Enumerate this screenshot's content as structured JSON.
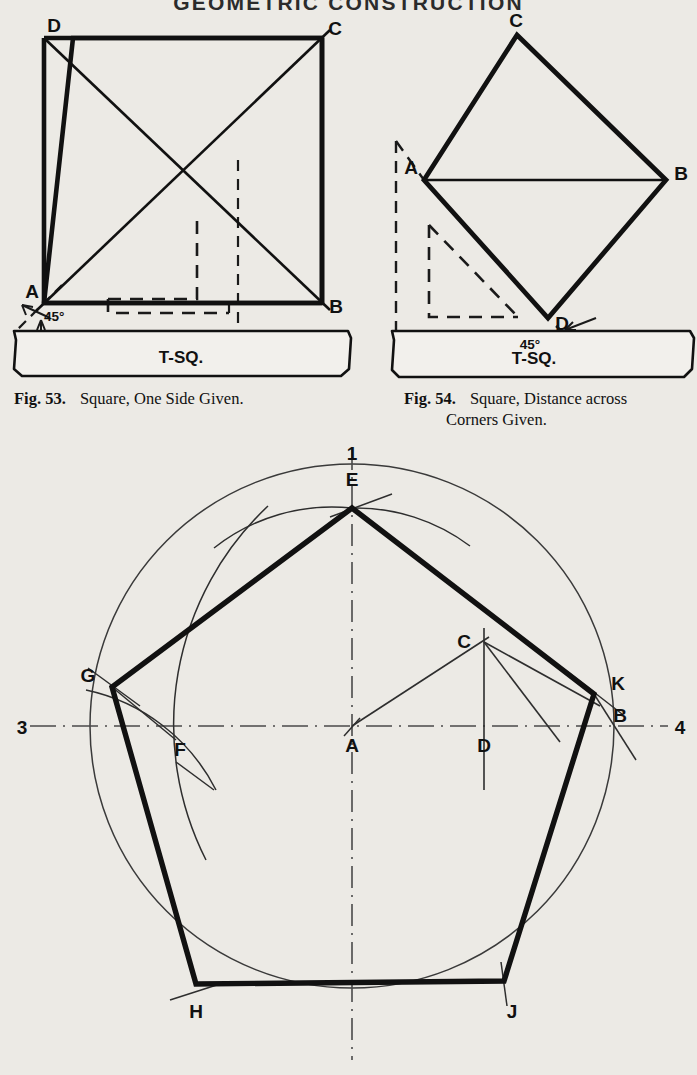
{
  "page": {
    "running_head": "GEOMETRIC CONSTRUCTION",
    "width": 697,
    "height": 1075,
    "paper_color": "#eceae5",
    "ink_color": "#111111"
  },
  "figures": [
    {
      "id": "fig-53",
      "number": "Fig. 53.",
      "caption": "Square, One Side Given.",
      "caption_lines": [
        "Square, One Side Given."
      ],
      "tool_label": "T-SQ.",
      "angle_label": "45°",
      "vertex_labels": [
        "D",
        "C",
        "A",
        "B"
      ],
      "description": "Square ABCD drawn with T-square and 45 degree triangle, diagonals shown"
    },
    {
      "id": "fig-54",
      "number": "Fig. 54.",
      "caption": "Square, Distance across Corners Given.",
      "caption_lines": [
        "Square, Distance across",
        "Corners Given."
      ],
      "tool_label": "T-SQ.",
      "angle_label": "45°",
      "vertex_labels": [
        "C",
        "A",
        "B",
        "D"
      ],
      "description": "Square on diagonal ACBD with horizontal diagonal AB"
    },
    {
      "id": "fig-pentagon",
      "vertex_labels": [
        "E",
        "G",
        "K",
        "H",
        "J"
      ],
      "construction_labels": [
        "A",
        "B",
        "C",
        "D",
        "F"
      ],
      "axis_labels": {
        "left": "3",
        "right": "4",
        "top": "1"
      },
      "description": "Regular pentagon inscribed in a circle, center A, constructed from radius bisection"
    }
  ],
  "drawing": {
    "fig53": {
      "square": {
        "ax": 44,
        "ay": 303,
        "bx": 322,
        "by": 303,
        "cx": 322,
        "cy": 38,
        "dx": 73,
        "dy": 38
      },
      "labels": {
        "D": "D",
        "C": "C",
        "A": "A",
        "B": "B"
      },
      "angle": "45°",
      "tsq": "T-SQ."
    },
    "fig54": {
      "diamond": {
        "cx": 517,
        "cy": 35,
        "ax": 424,
        "ay": 180,
        "bx": 666,
        "by": 180,
        "dx": 548,
        "dy": 318
      },
      "labels": {
        "C": "C",
        "A": "A",
        "B": "B",
        "D": "D"
      },
      "angle": "45°",
      "tsq": "T-SQ."
    },
    "pentagon": {
      "center": {
        "x": 352,
        "y": 726
      },
      "radius": 262,
      "vertices": {
        "E": {
          "x": 352,
          "y": 508
        },
        "G": {
          "x": 112,
          "y": 687
        },
        "K": {
          "x": 594,
          "y": 694
        },
        "H": {
          "x": 196,
          "y": 984
        },
        "J": {
          "x": 504,
          "y": 981
        }
      },
      "points": {
        "A": {
          "x": 352,
          "y": 726
        },
        "B": {
          "x": 613,
          "y": 726
        },
        "C": {
          "x": 484,
          "y": 642
        },
        "D": {
          "x": 484,
          "y": 726
        },
        "F": {
          "x": 192,
          "y": 776
        }
      },
      "axis": {
        "left": "3",
        "right": "4",
        "top": "1"
      }
    }
  }
}
